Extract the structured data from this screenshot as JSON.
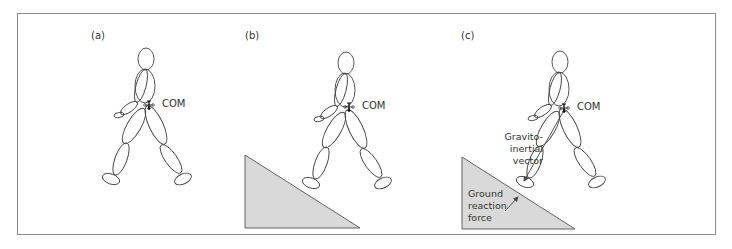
{
  "figure": {
    "panels": [
      {
        "id": "a",
        "label": "(a)",
        "com_label": "COM",
        "has_ramp": false
      },
      {
        "id": "b",
        "label": "(b)",
        "com_label": "COM",
        "has_ramp": true
      },
      {
        "id": "c",
        "label": "(c)",
        "com_label": "COM",
        "has_ramp": true,
        "annotations": {
          "gravito_inertial": [
            "Gravito-",
            "inertial",
            "vector"
          ],
          "ground_reaction": [
            "Ground",
            "reaction",
            "force"
          ]
        }
      }
    ],
    "colors": {
      "frame": "#8a8a8a",
      "outline": "#444444",
      "ramp_fill": "#d9d9d9",
      "text": "#333333"
    }
  }
}
